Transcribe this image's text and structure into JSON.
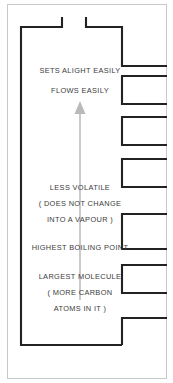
{
  "figure": {
    "background_color": "#ffffff",
    "outline_color": "#222222",
    "frame_color": "#c9c9c9",
    "arrow_color": "#b9b9b9",
    "text_color": "#3b3b3b"
  },
  "arrow": {
    "name": "upward-gradient-arrow",
    "direction": "up",
    "x": 80,
    "y_tail": 300,
    "y_tip": 103
  },
  "labels": [
    {
      "id": "l1",
      "text": "SETS ALIGHT EASILY",
      "x": 80,
      "y": 73
    },
    {
      "id": "l2",
      "text": "FLOWS EASILY",
      "x": 80,
      "y": 93
    },
    {
      "id": "l3",
      "text": "LESS VOLATILE",
      "x": 80,
      "y": 190
    },
    {
      "id": "l4",
      "text": "( DOES NOT CHANGE",
      "x": 80,
      "y": 206
    },
    {
      "id": "l5",
      "text": "INTO A VAPOUR )",
      "x": 80,
      "y": 222
    },
    {
      "id": "l6",
      "text": "HIGHEST BOILING POINT",
      "x": 80,
      "y": 250
    },
    {
      "id": "l7",
      "text": "LARGEST MOLECULE",
      "x": 80,
      "y": 279
    },
    {
      "id": "l8",
      "text": "( MORE CARBON",
      "x": 80,
      "y": 295
    },
    {
      "id": "l9",
      "text": "ATOMS IN IT )",
      "x": 80,
      "y": 311
    }
  ],
  "outer_frame": {
    "name": "page-border",
    "x": 7,
    "y": 4,
    "width": 160,
    "height": 375
  },
  "column": {
    "name": "column-body-outline",
    "path": "M 62 18 L 62 27 L 21 27 L 21 345 L 122 345 L 122 318 L 167 318 M 122 318 L 122 318 M 86 18 L 86 27 L 122 27 L 122 66 L 167 66"
  },
  "trays": [
    {
      "id": "tray-1",
      "y_top": 66,
      "y_bottom": 100,
      "x_left": 122,
      "x_right": 167
    },
    {
      "id": "tray-2",
      "y_top": 100,
      "y_bottom": 136,
      "x_left": 122,
      "x_right": 167
    },
    {
      "id": "tray-3",
      "y_top": 152,
      "y_bottom": 186,
      "x_left": 122,
      "x_right": 167
    },
    {
      "id": "tray-4",
      "y_top": 208,
      "y_bottom": 248,
      "x_left": 122,
      "x_right": 167
    },
    {
      "id": "tray-5",
      "y_top": 263,
      "y_bottom": 294,
      "x_left": 122,
      "x_right": 167
    },
    {
      "id": "tray-6",
      "y_top": 318,
      "y_bottom": 345,
      "x_left": 122,
      "x_right": 167
    }
  ]
}
